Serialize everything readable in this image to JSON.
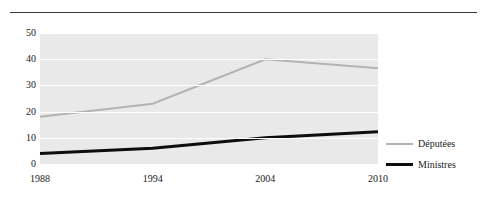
{
  "chart_data": {
    "type": "line",
    "title": "",
    "xlabel": "",
    "ylabel": "",
    "categories": [
      "1988",
      "1994",
      "2004",
      "2010"
    ],
    "ylim": [
      0,
      50
    ],
    "yticks": [
      "0",
      "10",
      "20",
      "30",
      "40",
      "50"
    ],
    "grid": true,
    "legend_position": "right",
    "series": [
      {
        "name": "Députées",
        "color": "#b3b3b3",
        "values": [
          18,
          23,
          40,
          36.5
        ]
      },
      {
        "name": "Ministres",
        "color": "#0d0d0d",
        "values": [
          4,
          6,
          10,
          12.3
        ]
      }
    ]
  },
  "legend": {
    "items": [
      {
        "label": "Députées"
      },
      {
        "label": "Ministres"
      }
    ]
  },
  "figure": {
    "top_rule": "horizontal-rule",
    "bottom_rule": "horizontal-rule"
  }
}
